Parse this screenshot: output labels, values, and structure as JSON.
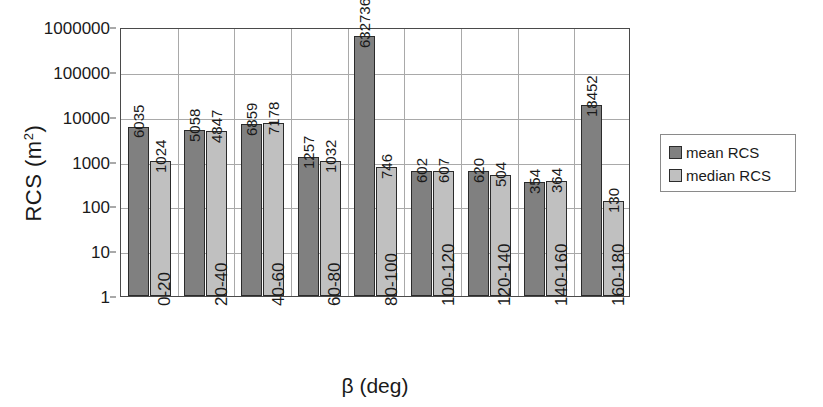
{
  "chart_data": {
    "type": "bar",
    "title": "",
    "xlabel": "β (deg)",
    "ylabel": "RCS (m²)",
    "ylabel_base": "RCS (m",
    "ylabel_sup": "2",
    "ylabel_close": ")",
    "yscale": "log",
    "ylim": [
      1,
      1000000
    ],
    "ytick_labels": [
      "1000000",
      "100000",
      "10000",
      "1000",
      "100",
      "10",
      "1"
    ],
    "ytick_values": [
      1000000,
      100000,
      10000,
      1000,
      100,
      10,
      1
    ],
    "grid": true,
    "legend_position": "right",
    "categories": [
      "0-20",
      "20-40",
      "40-60",
      "60-80",
      "80-100",
      "100-120",
      "120-140",
      "140-160",
      "160-180"
    ],
    "series": [
      {
        "name": "mean RCS",
        "color": "#808080",
        "values": [
          6035,
          5058,
          6859,
          1257,
          632736,
          602,
          620,
          354,
          18452
        ]
      },
      {
        "name": "median RCS",
        "color": "#c0c0c0",
        "values": [
          1024,
          4847,
          7178,
          1032,
          746,
          607,
          504,
          364,
          130
        ]
      }
    ],
    "data_labels": [
      [
        "6035",
        "1024"
      ],
      [
        "5058",
        "4847"
      ],
      [
        "6859",
        "7178"
      ],
      [
        "1257",
        "1032"
      ],
      [
        "632736",
        "746"
      ],
      [
        "602",
        "607"
      ],
      [
        "620",
        "504"
      ],
      [
        "354",
        "364"
      ],
      [
        "18452",
        "130"
      ]
    ]
  },
  "legend": {
    "items": [
      {
        "label": "mean RCS",
        "color": "#808080"
      },
      {
        "label": "median RCS",
        "color": "#c0c0c0"
      }
    ]
  }
}
